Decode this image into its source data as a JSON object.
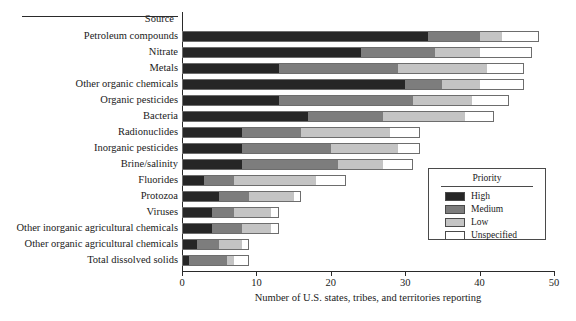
{
  "chart_data": {
    "type": "bar",
    "orientation": "horizontal",
    "stacked": true,
    "title": "",
    "xlabel": "Number of U.S. states, tribes, and territories reporting",
    "ylabel": "Source",
    "xlim": [
      0,
      50
    ],
    "xticks": [
      0,
      10,
      20,
      30,
      40,
      50
    ],
    "grid": false,
    "legend": {
      "title": "Priority",
      "position": "inside-right",
      "entries": [
        "High",
        "Medium",
        "Low",
        "Unspecified"
      ]
    },
    "colors": {
      "High": "#262626",
      "Medium": "#7d7d7d",
      "Low": "#c4c4c4",
      "Unspecified": "#ffffff"
    },
    "categories": [
      "Petroleum compounds",
      "Nitrate",
      "Metals",
      "Other organic chemicals",
      "Organic pesticides",
      "Bacteria",
      "Radionuclides",
      "Inorganic pesticides",
      "Brine/salinity",
      "Fluorides",
      "Protozoa",
      "Viruses",
      "Other inorganic agricultural chemicals",
      "Other organic agricultural chemicals",
      "Total dissolved solids"
    ],
    "series": [
      {
        "name": "High",
        "values": [
          33,
          24,
          13,
          30,
          13,
          17,
          8,
          8,
          8,
          3,
          5,
          4,
          4,
          2,
          1
        ]
      },
      {
        "name": "Medium",
        "values": [
          7,
          10,
          16,
          5,
          18,
          10,
          8,
          12,
          13,
          4,
          4,
          3,
          4,
          3,
          5
        ]
      },
      {
        "name": "Low",
        "values": [
          3,
          6,
          12,
          5,
          8,
          11,
          12,
          9,
          6,
          11,
          6,
          5,
          4,
          3,
          1
        ]
      },
      {
        "name": "Unspecified",
        "values": [
          5,
          7,
          5,
          6,
          5,
          4,
          4,
          3,
          4,
          4,
          1,
          1,
          1,
          1,
          2
        ]
      }
    ],
    "totals": [
      48,
      47,
      46,
      46,
      44,
      42,
      32,
      32,
      31,
      22,
      16,
      13,
      13,
      9,
      9
    ]
  }
}
